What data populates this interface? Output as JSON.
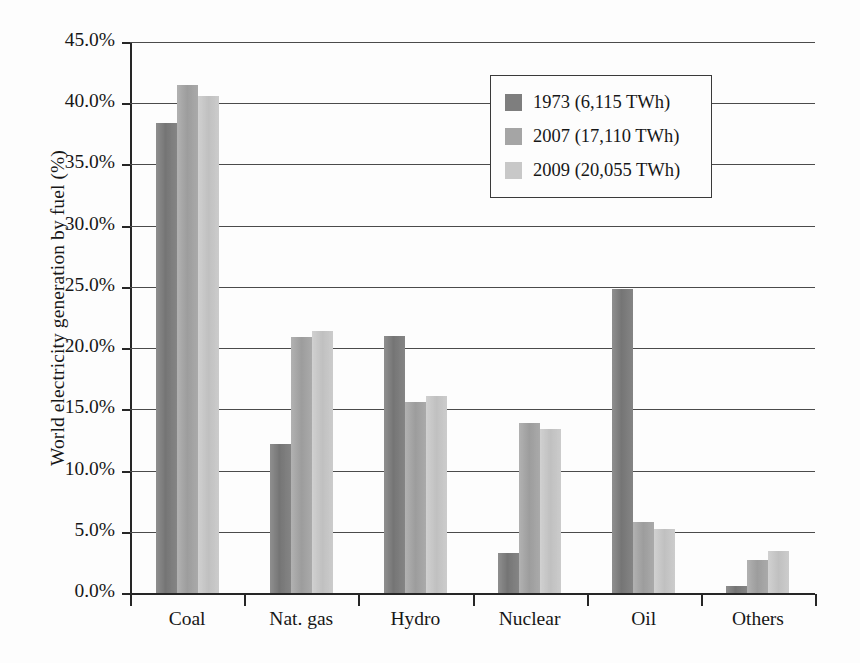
{
  "chart_data": {
    "type": "bar",
    "title": "",
    "xlabel": "",
    "ylabel": "World electricity generation by fuel (%)",
    "categories": [
      "Coal",
      "Nat. gas",
      "Hydro",
      "Nuclear",
      "Oil",
      "Others"
    ],
    "series": [
      {
        "name": "1973 (6,115 TWh)",
        "color": "#7e7e7e",
        "values": [
          38.4,
          12.2,
          21.0,
          3.3,
          24.8,
          0.6
        ]
      },
      {
        "name": "2007 (17,110 TWh)",
        "color": "#a5a5a5",
        "values": [
          41.5,
          20.9,
          15.6,
          13.9,
          5.8,
          2.7
        ]
      },
      {
        "name": "2009 (20,055 TWh)",
        "color": "#c8c8c8",
        "values": [
          40.6,
          21.4,
          16.1,
          13.4,
          5.2,
          3.4
        ]
      }
    ],
    "ylim": [
      0,
      45
    ],
    "ytick_step": 5,
    "ytick_labels": [
      "0.0%",
      "5.0%",
      "10.0%",
      "15.0%",
      "20.0%",
      "25.0%",
      "30.0%",
      "35.0%",
      "40.0%",
      "45.0%"
    ],
    "grid": "horizontal",
    "legend_position": "upper-right-inside",
    "legend_entries": [
      "1973 (6,115 TWh)",
      "2007 (17,110 TWh)",
      "2009 (20,055 TWh)"
    ]
  }
}
